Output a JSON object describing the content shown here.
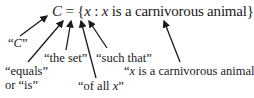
{
  "equation": {
    "set_name": "C",
    "equals": "=",
    "open_brace": "{",
    "var1": "x",
    "colon": ":",
    "var2": "x",
    "predicate": "is a carnivorous animal",
    "close_brace": "}"
  },
  "labels": {
    "c_label_open": "“",
    "c_label_var": "C",
    "c_label_close": "”",
    "equals_line1": "“equals”",
    "equals_line2": "or “is”",
    "the_set": "“the set”",
    "of_all_prefix": "“of all ",
    "of_all_var": "x",
    "of_all_suffix": "”",
    "such_that": "“such that”",
    "predicate_open": "“",
    "predicate_var": "x",
    "predicate_rest": " is a carnivorous animal”"
  },
  "colors": {
    "ink": "#1a1a1a",
    "background": "#ffffff"
  }
}
